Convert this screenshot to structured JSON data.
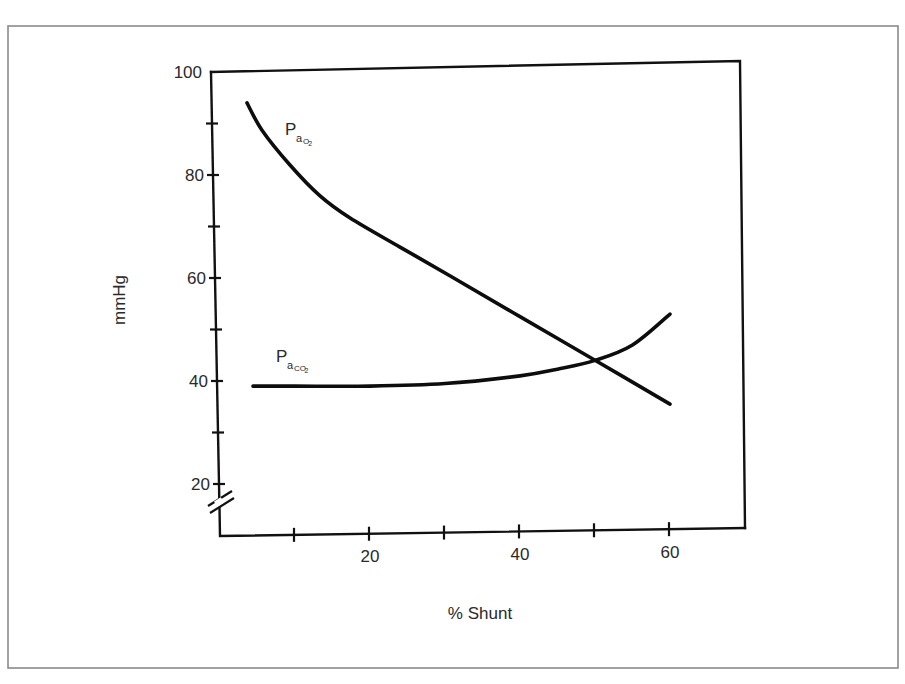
{
  "chart_data": {
    "type": "line",
    "title": "",
    "xlabel": "% Shunt",
    "ylabel": "mmHg",
    "xlim": [
      0,
      70
    ],
    "ylim": [
      15,
      100
    ],
    "y_axis_break": true,
    "grid": false,
    "legend": "inline labels",
    "x_ticks": [
      10,
      20,
      30,
      40,
      50,
      60
    ],
    "x_tick_labels": [
      {
        "value": 20,
        "label": "20"
      },
      {
        "value": 40,
        "label": "40"
      },
      {
        "value": 60,
        "label": "60"
      }
    ],
    "y_ticks": [
      20,
      30,
      40,
      50,
      60,
      70,
      80,
      90,
      100
    ],
    "y_tick_labels": [
      {
        "value": 20,
        "label": "20"
      },
      {
        "value": 40,
        "label": "40"
      },
      {
        "value": 60,
        "label": "60"
      },
      {
        "value": 80,
        "label": "80"
      },
      {
        "value": 100,
        "label": "100"
      }
    ],
    "series": [
      {
        "name": "PaO2",
        "label_main": "P",
        "label_sub": "a",
        "label_sub_gas": "O",
        "label_sub_num": "2",
        "x": [
          3.6,
          5.6,
          9.3,
          13.3,
          17.3,
          24,
          30.7,
          40,
          50.4,
          60
        ],
        "values": [
          94,
          88.7,
          82,
          76,
          71.7,
          66,
          60.4,
          52.5,
          43.7,
          35.5
        ]
      },
      {
        "name": "PaCO2",
        "label_main": "P",
        "label_sub": "a",
        "label_sub_gas": "CO",
        "label_sub_num": "2",
        "x": [
          4.4,
          10,
          20,
          30,
          40,
          45,
          50,
          55,
          60
        ],
        "values": [
          39,
          39,
          39,
          39.5,
          41,
          42.3,
          44,
          47,
          53
        ]
      }
    ],
    "annotations": [
      {
        "text": "PaO2",
        "near_x": 9,
        "near_y": 91
      },
      {
        "text": "PaCO2",
        "near_x": 8,
        "near_y": 44
      }
    ]
  }
}
